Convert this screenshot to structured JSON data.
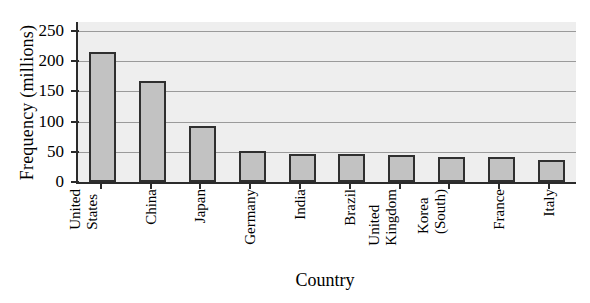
{
  "chart_data": {
    "type": "bar",
    "title": "",
    "xlabel": "Country",
    "ylabel": "Frequency (millions)",
    "categories": [
      "United States",
      "China",
      "Japan",
      "Germany",
      "India",
      "Brazil",
      "United Kingdom",
      "Korea (South)",
      "France",
      "Italy"
    ],
    "category_lines": [
      [
        "United",
        "States"
      ],
      [
        "China"
      ],
      [
        "Japan"
      ],
      [
        "Germany"
      ],
      [
        "India"
      ],
      [
        "Brazil"
      ],
      [
        "United",
        "Kingdom"
      ],
      [
        "Korea",
        "(South)"
      ],
      [
        "France"
      ],
      [
        "Italy"
      ]
    ],
    "values": [
      215,
      168,
      93,
      51,
      47,
      47,
      44,
      42,
      41,
      37
    ],
    "ylim": [
      0,
      265
    ],
    "yticks": [
      0,
      50,
      100,
      150,
      200,
      250
    ],
    "ytick_labels": [
      "0",
      "50",
      "100",
      "150",
      "200",
      "250"
    ],
    "grid": "horizontal",
    "legend": "none",
    "bar_fill": "#c2c2c2",
    "bar_edge": "#2f2f2f",
    "plot_bg": "#eeeeee",
    "gridline_color": "#9a9a9a",
    "axis_color": "#2b2b2b"
  }
}
